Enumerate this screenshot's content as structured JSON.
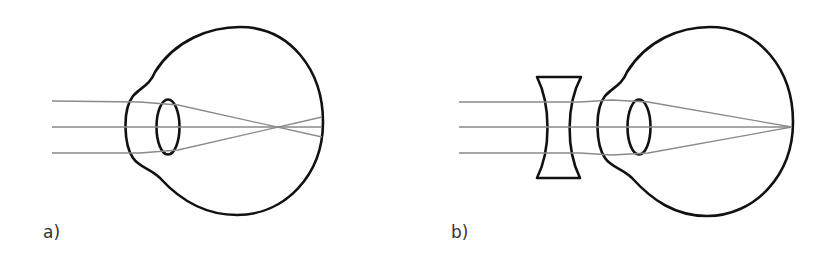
{
  "figure": {
    "panels": [
      {
        "id": "a",
        "label": "a)",
        "description": "Myopic eye: parallel rays focus in front of the retina",
        "colors": {
          "outline": "#111111",
          "ray": "#8a8a8a"
        }
      },
      {
        "id": "b",
        "label": "b)",
        "description": "Myopia corrected with a concave (diverging) lens: rays focus on the retina",
        "colors": {
          "outline": "#111111",
          "ray": "#8a8a8a"
        }
      }
    ]
  }
}
